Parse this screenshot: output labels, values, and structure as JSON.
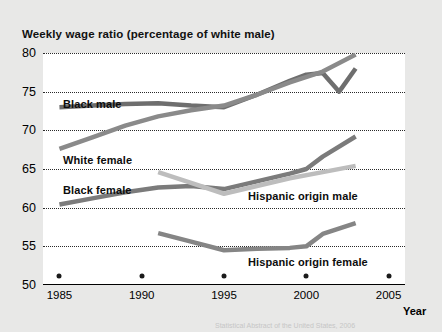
{
  "chart_data": {
    "type": "line",
    "title": "Weekly wage ratio (percentage of white male)",
    "xlabel": "Year",
    "ylabel": "",
    "xlim": [
      1984,
      2006
    ],
    "ylim": [
      50,
      80
    ],
    "yticks": [
      50,
      55,
      60,
      65,
      70,
      75,
      80
    ],
    "xticks": [
      1985,
      1990,
      1995,
      2000,
      2005
    ],
    "grid": "horizontal-dotted",
    "legend": "inline-labels",
    "series": [
      {
        "name": "Black male",
        "color": "#6e6e6e",
        "x": [
          1985,
          1987,
          1989,
          1991,
          1993,
          1995,
          1997,
          1999,
          2000,
          2001,
          2002,
          2003
        ],
        "y": [
          73.0,
          73.2,
          73.4,
          73.5,
          73.2,
          73.0,
          74.6,
          76.4,
          77.2,
          77.4,
          75.0,
          78.0
        ]
      },
      {
        "name": "White female",
        "color": "#8a8a8a",
        "x": [
          1985,
          1987,
          1989,
          1991,
          1993,
          1995,
          1997,
          1999,
          2001,
          2003
        ],
        "y": [
          67.6,
          69.1,
          70.6,
          71.8,
          72.6,
          73.2,
          74.6,
          76.2,
          77.6,
          79.8
        ]
      },
      {
        "name": "Black female",
        "color": "#7b7b7b",
        "x": [
          1985,
          1987,
          1989,
          1991,
          1993,
          1995,
          1997,
          1999,
          2000,
          2001,
          2003
        ],
        "y": [
          60.4,
          61.2,
          62.0,
          62.6,
          62.8,
          62.4,
          63.4,
          64.4,
          65.0,
          66.6,
          69.2
        ]
      },
      {
        "name": "Hispanic origin male",
        "color": "#bdbdbd",
        "x": [
          1991,
          1993,
          1995,
          1997,
          1999,
          2001,
          2003
        ],
        "y": [
          64.6,
          63.2,
          61.8,
          62.8,
          63.8,
          64.6,
          65.4
        ]
      },
      {
        "name": "Hispanic origin female",
        "color": "#858585",
        "x": [
          1991,
          1993,
          1995,
          1997,
          1999,
          2000,
          2001,
          2003
        ],
        "y": [
          56.7,
          55.6,
          54.5,
          54.7,
          54.8,
          55.0,
          56.6,
          58.0
        ]
      }
    ],
    "series_label_positions": [
      {
        "name": "Black male",
        "left": 20,
        "top": 45
      },
      {
        "name": "White female",
        "left": 20,
        "top": 101
      },
      {
        "name": "Black female",
        "left": 20,
        "top": 131
      },
      {
        "name": "Hispanic origin male",
        "left": 205,
        "top": 137
      },
      {
        "name": "Hispanic origin female",
        "left": 205,
        "top": 203
      }
    ]
  },
  "footer": {
    "note": "Statistical Abstract of the United States, 2006"
  }
}
